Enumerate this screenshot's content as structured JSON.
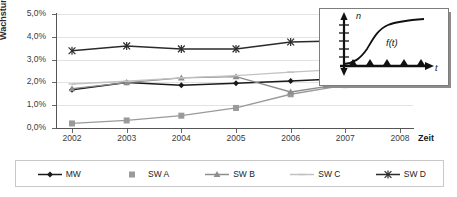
{
  "chart_data": {
    "type": "line",
    "title": "",
    "xlabel": "Zeit",
    "ylabel": "Wachstum",
    "categories": [
      "2002",
      "2003",
      "2004",
      "2005",
      "2006",
      "2007",
      "2008"
    ],
    "x": [
      2002,
      2003,
      2004,
      2005,
      2006,
      2007,
      2008
    ],
    "ylim": [
      0.0,
      5.0
    ],
    "yticks": [
      "0,0%",
      "1,0%",
      "2,0%",
      "3,0%",
      "4,0%",
      "5,0%"
    ],
    "ytick_values": [
      0.0,
      1.0,
      2.0,
      3.0,
      4.0,
      5.0
    ],
    "grid": true,
    "legend_position": "bottom",
    "value_unit": "percent",
    "series": [
      {
        "name": "MW",
        "marker": "diamond",
        "color": "#1a1a1a",
        "values": [
          1.68,
          2.0,
          1.87,
          1.96,
          2.06,
          2.17,
          2.17
        ]
      },
      {
        "name": "SW A",
        "marker": "square",
        "color": "#9a9a9a",
        "values": [
          0.2,
          0.33,
          0.54,
          0.88,
          1.48,
          1.88,
          1.94
        ]
      },
      {
        "name": "SW B",
        "marker": "triangle",
        "color": "#8d8d8d",
        "values": [
          1.73,
          1.99,
          2.2,
          2.25,
          1.58,
          1.95,
          1.95
        ]
      },
      {
        "name": "SW C",
        "marker": "line",
        "color": "#c2c2c2",
        "values": [
          1.93,
          2.05,
          2.2,
          2.3,
          2.45,
          2.58,
          2.62
        ]
      },
      {
        "name": "SW D",
        "marker": "asterisk",
        "color": "#2b2b2b",
        "values": [
          3.39,
          3.6,
          3.47,
          3.47,
          3.77,
          3.83,
          3.83
        ]
      }
    ]
  },
  "legend": {
    "items": [
      {
        "label": "MW"
      },
      {
        "label": "SW A"
      },
      {
        "label": "SW B"
      },
      {
        "label": "SW C"
      },
      {
        "label": "SW D"
      }
    ]
  },
  "inset": {
    "y_axis_label": "n",
    "x_axis_label": "t",
    "curve_label": "f(t)",
    "curve_type": "logistic-sigmoid",
    "marker_count": 5,
    "marker_shape": "triangle"
  }
}
